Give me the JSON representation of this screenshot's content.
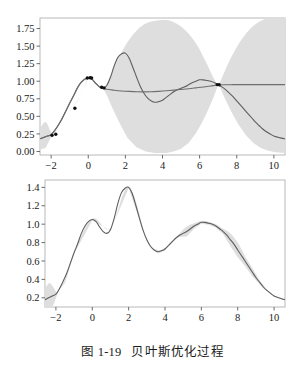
{
  "caption": {
    "label": "图 1-19",
    "title": "贝叶斯优化过程"
  },
  "colors": {
    "band": "#dedede",
    "curve_true": "#5e5e5e",
    "curve_mean": "#6e6e6e",
    "point": "#111111",
    "frame": "#b9b9b9",
    "background": "#ffffff"
  },
  "chart_data": [
    {
      "type": "line",
      "title": "",
      "xlabel": "",
      "ylabel": "",
      "xlim": [
        -2.6,
        10.6
      ],
      "ylim": [
        -0.05,
        1.9
      ],
      "xticks": [
        -2,
        0,
        2,
        4,
        6,
        8,
        10
      ],
      "xtick_labels": [
        "−2",
        "0",
        "2",
        "4",
        "6",
        "8",
        "10"
      ],
      "yticks": [
        0.0,
        0.25,
        0.5,
        0.75,
        1.0,
        1.25,
        1.5,
        1.75
      ],
      "ytick_labels": [
        "0.00",
        "0.25",
        "0.50",
        "0.75",
        "1.00",
        "1.25",
        "1.50",
        "1.75"
      ],
      "grid": false,
      "legend": "none",
      "series": [
        {
          "name": "true function",
          "kind": "line",
          "x": [
            -2.6,
            -2.4,
            -2.2,
            -2.0,
            -1.8,
            -1.6,
            -1.4,
            -1.2,
            -1.0,
            -0.8,
            -0.6,
            -0.4,
            -0.2,
            0.0,
            0.2,
            0.4,
            0.6,
            0.8,
            1.0,
            1.2,
            1.4,
            1.6,
            1.8,
            2.0,
            2.2,
            2.4,
            2.6,
            2.8,
            3.0,
            3.2,
            3.4,
            3.6,
            3.8,
            4.0,
            4.2,
            4.4,
            4.6,
            4.8,
            5.0,
            5.2,
            5.4,
            5.6,
            5.8,
            6.0,
            6.2,
            6.4,
            6.6,
            6.8,
            7.0,
            7.2,
            7.4,
            7.6,
            7.8,
            8.0,
            8.2,
            8.4,
            8.6,
            8.8,
            9.0,
            9.2,
            9.4,
            9.6,
            9.8,
            10.0,
            10.4,
            10.6
          ],
          "y": [
            0.18,
            0.2,
            0.22,
            0.24,
            0.3,
            0.38,
            0.47,
            0.58,
            0.69,
            0.79,
            0.9,
            0.98,
            1.03,
            1.05,
            1.03,
            0.97,
            0.92,
            0.9,
            0.94,
            1.06,
            1.22,
            1.34,
            1.39,
            1.4,
            1.33,
            1.2,
            1.06,
            0.93,
            0.83,
            0.76,
            0.72,
            0.7,
            0.71,
            0.73,
            0.77,
            0.81,
            0.85,
            0.88,
            0.9,
            0.92,
            0.95,
            0.98,
            1.0,
            1.02,
            1.02,
            1.01,
            1.0,
            0.98,
            0.95,
            0.92,
            0.88,
            0.83,
            0.78,
            0.72,
            0.66,
            0.6,
            0.54,
            0.48,
            0.42,
            0.37,
            0.32,
            0.28,
            0.25,
            0.22,
            0.19,
            0.18
          ]
        },
        {
          "name": "surrogate mean",
          "kind": "line",
          "x": [
            -2.6,
            -2.2,
            -2.0,
            -1.6,
            -1.2,
            -0.8,
            -0.4,
            0.0,
            0.2,
            0.4,
            0.6,
            0.8,
            1.0,
            1.4,
            1.8,
            2.2,
            2.6,
            3.0,
            3.4,
            3.8,
            4.2,
            4.6,
            5.0,
            5.4,
            5.8,
            6.2,
            6.6,
            7.0,
            7.4,
            7.8,
            8.2,
            8.6,
            9.0,
            9.4,
            9.8,
            10.2,
            10.6
          ],
          "y": [
            0.18,
            0.22,
            0.24,
            0.38,
            0.58,
            0.79,
            0.98,
            1.05,
            1.03,
            0.97,
            0.92,
            0.9,
            0.885,
            0.872,
            0.862,
            0.855,
            0.85,
            0.848,
            0.85,
            0.856,
            0.864,
            0.874,
            0.884,
            0.894,
            0.906,
            0.918,
            0.932,
            0.946,
            0.95,
            0.951,
            0.951,
            0.951,
            0.951,
            0.951,
            0.951,
            0.951,
            0.951
          ]
        },
        {
          "name": "confidence band",
          "kind": "band",
          "x": [
            -2.6,
            -2.3,
            -2.05,
            -1.9,
            -1.6,
            -1.0,
            -0.4,
            0.0,
            0.4,
            0.8,
            1.0,
            1.3,
            1.7,
            2.1,
            2.6,
            3.1,
            3.6,
            4.2,
            4.6,
            5.0,
            5.4,
            5.8,
            6.1,
            6.4,
            6.7,
            6.9,
            7.0,
            7.1,
            7.35,
            7.7,
            8.1,
            8.5,
            8.9,
            9.3,
            9.7,
            10.1,
            10.6
          ],
          "upper": [
            0.33,
            0.42,
            0.3,
            0.25,
            0.38,
            0.58,
            0.79,
            1.05,
            0.97,
            0.9,
            0.97,
            1.14,
            1.36,
            1.55,
            1.72,
            1.82,
            1.86,
            1.87,
            1.84,
            1.78,
            1.68,
            1.54,
            1.4,
            1.24,
            1.07,
            0.98,
            0.95,
            0.99,
            1.14,
            1.34,
            1.53,
            1.68,
            1.79,
            1.86,
            1.9,
            1.92,
            1.93
          ],
          "lower": [
            0.03,
            0.05,
            0.18,
            0.22,
            0.38,
            0.58,
            0.79,
            1.05,
            0.97,
            0.9,
            0.8,
            0.62,
            0.4,
            0.2,
            0.06,
            0.0,
            -0.02,
            -0.02,
            0.0,
            0.04,
            0.12,
            0.26,
            0.4,
            0.56,
            0.74,
            0.88,
            0.95,
            0.91,
            0.76,
            0.57,
            0.38,
            0.23,
            0.12,
            0.05,
            0.01,
            -0.01,
            -0.02
          ]
        },
        {
          "name": "observations",
          "kind": "points",
          "x": [
            -1.95,
            -1.75,
            -0.72,
            -0.05,
            0.1,
            0.18,
            0.72,
            0.85,
            6.95,
            7.05
          ],
          "y": [
            0.23,
            0.245,
            0.615,
            1.045,
            1.05,
            1.045,
            0.915,
            0.905,
            0.952,
            0.95
          ]
        }
      ]
    },
    {
      "type": "line",
      "title": "",
      "xlabel": "",
      "ylabel": "",
      "xlim": [
        -2.6,
        10.6
      ],
      "ylim": [
        0.1,
        1.48
      ],
      "xticks": [
        -2,
        0,
        2,
        4,
        6,
        8,
        10
      ],
      "xtick_labels": [
        "−2",
        "0",
        "2",
        "4",
        "6",
        "8",
        "10"
      ],
      "yticks": [
        0.2,
        0.4,
        0.6,
        0.8,
        1.0,
        1.2,
        1.4
      ],
      "ytick_labels": [
        "0.2",
        "0.4",
        "0.6",
        "0.8",
        "1.0",
        "1.2",
        "1.4"
      ],
      "grid": false,
      "legend": "none",
      "series": [
        {
          "name": "true function",
          "kind": "line",
          "x": [
            -2.6,
            -2.4,
            -2.2,
            -2.0,
            -1.8,
            -1.6,
            -1.4,
            -1.2,
            -1.0,
            -0.8,
            -0.6,
            -0.4,
            -0.2,
            0.0,
            0.2,
            0.4,
            0.6,
            0.8,
            1.0,
            1.2,
            1.4,
            1.6,
            1.8,
            2.0,
            2.2,
            2.4,
            2.6,
            2.8,
            3.0,
            3.2,
            3.4,
            3.6,
            3.8,
            4.0,
            4.2,
            4.4,
            4.6,
            4.8,
            5.0,
            5.2,
            5.4,
            5.6,
            5.8,
            6.0,
            6.2,
            6.4,
            6.6,
            6.8,
            7.0,
            7.2,
            7.4,
            7.6,
            7.8,
            8.0,
            8.2,
            8.4,
            8.6,
            8.8,
            9.0,
            9.2,
            9.4,
            9.6,
            9.8,
            10.0,
            10.4,
            10.6
          ],
          "y": [
            0.18,
            0.2,
            0.22,
            0.24,
            0.3,
            0.38,
            0.47,
            0.58,
            0.69,
            0.79,
            0.9,
            0.98,
            1.03,
            1.05,
            1.03,
            0.97,
            0.92,
            0.9,
            0.94,
            1.06,
            1.22,
            1.34,
            1.39,
            1.4,
            1.33,
            1.2,
            1.06,
            0.93,
            0.83,
            0.76,
            0.72,
            0.7,
            0.71,
            0.73,
            0.77,
            0.81,
            0.85,
            0.88,
            0.9,
            0.92,
            0.95,
            0.98,
            1.0,
            1.02,
            1.02,
            1.01,
            1.0,
            0.98,
            0.95,
            0.92,
            0.88,
            0.83,
            0.78,
            0.72,
            0.66,
            0.6,
            0.54,
            0.48,
            0.42,
            0.37,
            0.32,
            0.28,
            0.25,
            0.22,
            0.19,
            0.18
          ]
        },
        {
          "name": "confidence band",
          "kind": "band",
          "x": [
            -2.6,
            -2.35,
            -2.1,
            -1.95,
            -1.8,
            -1.5,
            -1.0,
            0.0,
            1.0,
            2.0,
            3.0,
            3.6,
            4.0,
            4.4,
            4.8,
            5.2,
            5.6,
            6.0,
            6.4,
            6.8,
            7.2,
            7.6,
            8.0,
            8.4,
            8.8,
            9.4,
            10.0,
            10.6
          ],
          "upper": [
            0.3,
            0.36,
            0.3,
            0.255,
            0.31,
            0.4,
            0.7,
            1.06,
            0.95,
            1.41,
            0.84,
            0.72,
            0.745,
            0.8,
            0.9,
            0.975,
            1.01,
            1.035,
            1.025,
            1.0,
            0.95,
            0.9,
            0.8,
            0.655,
            0.525,
            0.335,
            0.225,
            0.19
          ]
        }
      ]
    }
  ]
}
